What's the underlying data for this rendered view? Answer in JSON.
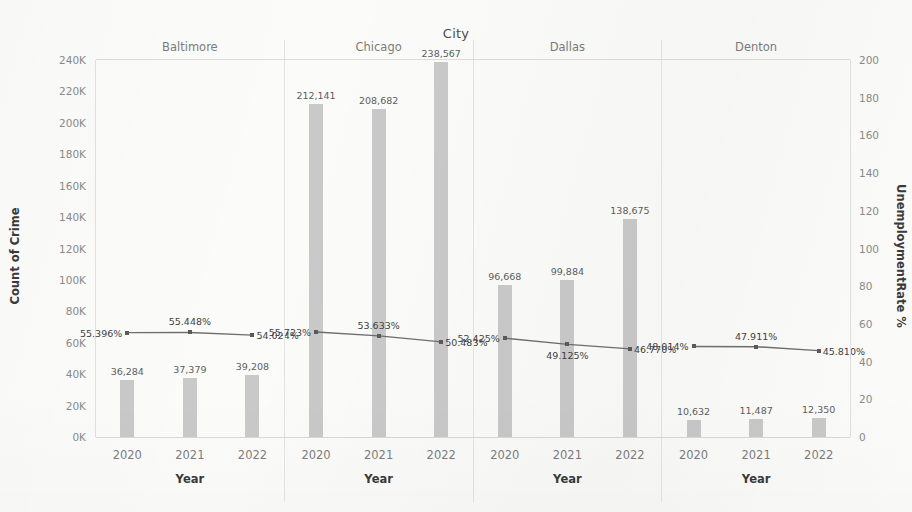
{
  "chart_data": {
    "type": "bar",
    "title": "City",
    "xlabel": "Year",
    "ylabel": "Count of Crime",
    "y2label": "UnemploymentRate %",
    "categories": [
      "2020",
      "2021",
      "2022"
    ],
    "ylim": [
      0,
      240000
    ],
    "y2lim": [
      0,
      200
    ],
    "grid": false,
    "legend": "none",
    "facet_by": "City",
    "y_ticks": [
      "0K",
      "20K",
      "40K",
      "60K",
      "80K",
      "100K",
      "120K",
      "140K",
      "160K",
      "180K",
      "200K",
      "220K",
      "240K"
    ],
    "y_tick_values": [
      0,
      20000,
      40000,
      60000,
      80000,
      100000,
      120000,
      140000,
      160000,
      180000,
      200000,
      220000,
      240000
    ],
    "y2_ticks": [
      "0",
      "20",
      "40",
      "60",
      "80",
      "100",
      "120",
      "140",
      "160",
      "180",
      "200"
    ],
    "y2_tick_values": [
      0,
      20,
      40,
      60,
      80,
      100,
      120,
      140,
      160,
      180,
      200
    ],
    "panels": [
      {
        "name": "Baltimore",
        "bars": {
          "name": "Count of Crime",
          "values": [
            36284,
            37379,
            39208
          ],
          "labels": [
            "36,284",
            "37,379",
            "39,208"
          ]
        },
        "line": {
          "name": "UnemploymentRate %",
          "values": [
            55.396,
            55.448,
            54.024
          ],
          "labels": [
            "55.396%",
            "55.448%",
            "54.024%"
          ],
          "label_positions": [
            "left",
            "mid",
            "right"
          ]
        }
      },
      {
        "name": "Chicago",
        "bars": {
          "name": "Count of Crime",
          "values": [
            212141,
            208682,
            238567
          ],
          "labels": [
            "212,141",
            "208,682",
            "238,567"
          ]
        },
        "line": {
          "name": "UnemploymentRate %",
          "values": [
            55.723,
            53.633,
            50.483
          ],
          "labels": [
            "55.723%",
            "53.633%",
            "50.483%"
          ],
          "label_positions": [
            "left",
            "mid",
            "right"
          ]
        }
      },
      {
        "name": "Dallas",
        "bars": {
          "name": "Count of Crime",
          "values": [
            96668,
            99884,
            138675
          ],
          "labels": [
            "96,668",
            "99,884",
            "138,675"
          ]
        },
        "line": {
          "name": "UnemploymentRate %",
          "values": [
            52.425,
            49.125,
            46.77
          ],
          "labels": [
            "52.425%",
            "49.125%",
            "46.770%"
          ],
          "label_positions": [
            "left",
            "below",
            "right"
          ]
        }
      },
      {
        "name": "Denton",
        "bars": {
          "name": "Count of Crime",
          "values": [
            10632,
            11487,
            12350
          ],
          "labels": [
            "10,632",
            "11,487",
            "12,350"
          ]
        },
        "line": {
          "name": "UnemploymentRate %",
          "values": [
            48.014,
            47.911,
            45.81
          ],
          "labels": [
            "48.014%",
            "47.911%",
            "45.810%"
          ],
          "label_positions": [
            "left",
            "mid",
            "right"
          ]
        }
      }
    ],
    "colors": {
      "bar": "#c9c9c9",
      "line": "#6e6e6e",
      "marker": "#5a5a5a",
      "axis_text": "#8a8a8a",
      "title_text": "#4d4d4d",
      "background": "#fbfbfa"
    }
  }
}
